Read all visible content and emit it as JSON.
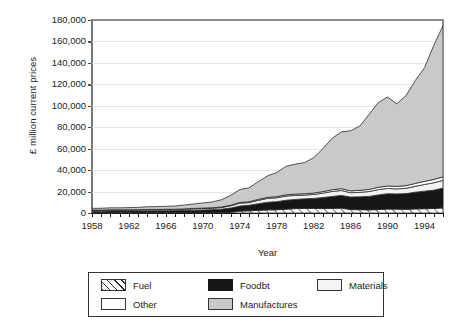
{
  "chart_data": {
    "type": "area",
    "stacked": true,
    "title": "",
    "xlabel": "Year",
    "ylabel": "£ million current prices",
    "xlim": [
      1958,
      1996
    ],
    "ylim": [
      0,
      180000
    ],
    "ytick_step": 20000,
    "ytick_labels": [
      "0",
      "20,000",
      "40,000",
      "60,000",
      "80,000",
      "100,000",
      "120,000",
      "140,000",
      "160,000",
      "180,000"
    ],
    "xtick_labels": [
      "1958",
      "1962",
      "1966",
      "1970",
      "1974",
      "1978",
      "1982",
      "1986",
      "1990",
      "1994"
    ],
    "xtick_years_minor_step": 1,
    "grid": "horizontal",
    "legend_position": "below-plot",
    "x": [
      1958,
      1959,
      1960,
      1961,
      1962,
      1963,
      1964,
      1965,
      1966,
      1967,
      1968,
      1969,
      1970,
      1971,
      1972,
      1973,
      1974,
      1975,
      1976,
      1977,
      1978,
      1979,
      1980,
      1981,
      1982,
      1983,
      1984,
      1985,
      1986,
      1987,
      1988,
      1989,
      1990,
      1991,
      1992,
      1993,
      1994,
      1995,
      1996
    ],
    "series": [
      {
        "name": "Fuel",
        "fill": "hatch-diagonal",
        "values": [
          150,
          150,
          160,
          170,
          180,
          190,
          200,
          210,
          230,
          250,
          270,
          300,
          340,
          420,
          470,
          620,
          1750,
          2050,
          2500,
          2900,
          3000,
          3600,
          4100,
          4300,
          4200,
          4100,
          4300,
          4600,
          3200,
          3100,
          2900,
          3200,
          3700,
          3600,
          3500,
          3800,
          4000,
          4200,
          4800
        ]
      },
      {
        "name": "Foodbt",
        "fill": "#161616",
        "values": [
          1500,
          1500,
          1600,
          1600,
          1650,
          1700,
          1800,
          1850,
          1900,
          1950,
          2100,
          2300,
          2500,
          2700,
          3100,
          4000,
          4800,
          5200,
          6200,
          7100,
          7600,
          8300,
          8600,
          8900,
          9400,
          10300,
          11200,
          11800,
          11700,
          12000,
          12600,
          13700,
          14300,
          14200,
          14600,
          15600,
          16400,
          17100,
          18400
        ]
      },
      {
        "name": "Materials",
        "fill": "#f2f2f2",
        "values": [
          900,
          880,
          950,
          930,
          920,
          960,
          1050,
          1020,
          1000,
          1020,
          1150,
          1300,
          1350,
          1350,
          1500,
          2100,
          2600,
          2500,
          3100,
          3600,
          3600,
          3900,
          3700,
          3500,
          3700,
          4100,
          4600,
          4600,
          4000,
          4200,
          4500,
          4900,
          4900,
          4700,
          4900,
          5500,
          6200,
          6900,
          7200
        ]
      },
      {
        "name": "Other",
        "fill": "#ffffff",
        "values": [
          200,
          200,
          210,
          220,
          230,
          240,
          260,
          270,
          280,
          300,
          320,
          350,
          380,
          420,
          470,
          600,
          700,
          750,
          900,
          1000,
          1050,
          1150,
          1200,
          1250,
          1300,
          1450,
          1600,
          1700,
          1750,
          1850,
          2000,
          2200,
          2300,
          2350,
          2500,
          2700,
          2900,
          3100,
          3300
        ]
      },
      {
        "name": "Manufactures",
        "fill": "#c9c9c9",
        "values": [
          1600,
          1700,
          1900,
          1900,
          2000,
          2200,
          2500,
          2600,
          2800,
          3000,
          3600,
          4200,
          4800,
          5400,
          6800,
          9000,
          12000,
          13000,
          16500,
          20000,
          22500,
          26500,
          28000,
          29000,
          33000,
          40000,
          48000,
          53000,
          56000,
          60000,
          70000,
          79000,
          83000,
          77000,
          84000,
          96000,
          106000,
          125000,
          141000
        ]
      }
    ],
    "totals_note": "stacked totals rise from ~4,350 (1958) to ~174,700 (1996)"
  },
  "legend": {
    "items": [
      {
        "label": "Fuel",
        "swatch": "fuel-swatch"
      },
      {
        "label": "Foodbt",
        "swatch": "foodbt-swatch"
      },
      {
        "label": "Materials",
        "swatch": "materials-swatch"
      },
      {
        "label": "Other",
        "swatch": "other-swatch"
      },
      {
        "label": "Manufactures",
        "swatch": "manufactures-swatch"
      }
    ]
  },
  "colors": {
    "foodbt": "#161616",
    "manufactures": "#c9c9c9",
    "materials": "#f2f2f2",
    "other": "#ffffff",
    "axis": "#1a1a1a",
    "grid": "#e6e6e6"
  }
}
